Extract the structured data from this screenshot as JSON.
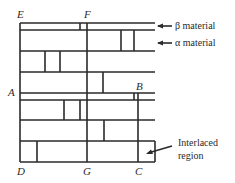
{
  "figure": {
    "point_labels": {
      "E": "E",
      "F": "F",
      "A": "A",
      "B": "B",
      "D": "D",
      "G": "G",
      "C": "C"
    },
    "annotations": {
      "beta": "β material",
      "alpha": "α material",
      "interlaced_line1": "Interlaced",
      "interlaced_line2": "region"
    },
    "colors": {
      "line": "#2a2a2a",
      "background": "#ffffff"
    }
  }
}
